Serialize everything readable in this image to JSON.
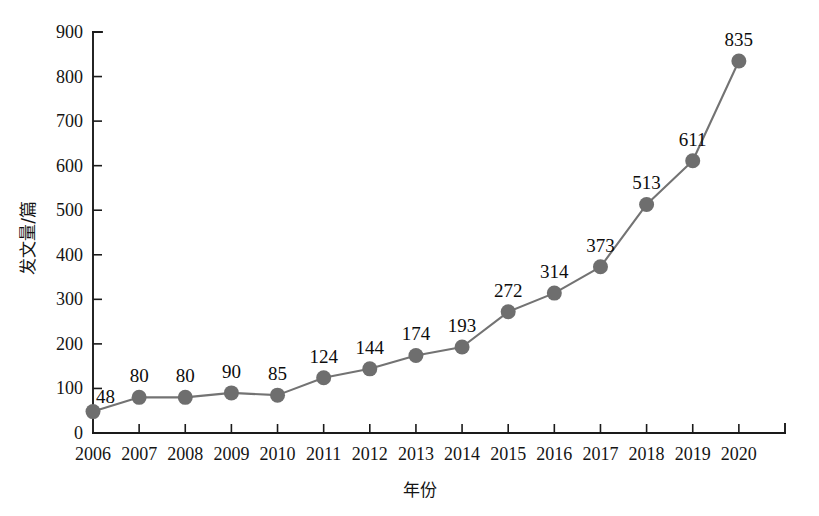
{
  "chart_data": {
    "type": "line",
    "title": "",
    "xlabel": "年份",
    "ylabel": "发文量/篇",
    "categories": [
      "2006",
      "2007",
      "2008",
      "2009",
      "2010",
      "2011",
      "2012",
      "2013",
      "2014",
      "2015",
      "2016",
      "2017",
      "2018",
      "2019",
      "2020"
    ],
    "values": [
      48,
      80,
      80,
      90,
      85,
      124,
      144,
      174,
      193,
      272,
      314,
      373,
      513,
      611,
      835
    ],
    "point_labels": [
      "48",
      "80",
      "80",
      "90",
      "85",
      "124",
      "144",
      "174",
      "193",
      "272",
      "314",
      "373",
      "513",
      "611",
      "835"
    ],
    "ylim": [
      0,
      900
    ],
    "y_ticks": [
      "0",
      "100",
      "200",
      "300",
      "400",
      "500",
      "600",
      "700",
      "800",
      "900"
    ],
    "y_tick_values": [
      0,
      100,
      200,
      300,
      400,
      500,
      600,
      700,
      800,
      900
    ],
    "grid": false,
    "legend": "none",
    "series_color": "#6e6e6e",
    "marker": "circle",
    "axis_color": "#1a1a1a",
    "background": "#ffffff"
  }
}
